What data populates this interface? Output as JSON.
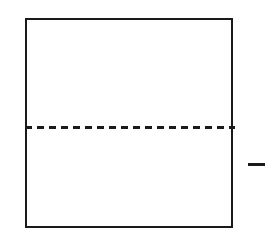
{
  "figure": {
    "kind": "geometric-diagram",
    "background_color": "#ffffff",
    "stroke_color": "#1a1a1a",
    "canvas": {
      "width": 265,
      "height": 236
    },
    "shapes": {
      "outer_rect": {
        "name": "square-outline",
        "x": 25,
        "y": 18,
        "width": 208,
        "height": 210,
        "stroke_width": 2,
        "fill": "#ffffff",
        "style": "solid"
      },
      "divider_line": {
        "name": "horizontal-dashed-divider",
        "x": 25,
        "y": 127,
        "length": 210,
        "stroke_width": 3,
        "style": "dashed",
        "dash_length": 7,
        "dash_gap": 5
      },
      "right_tick": {
        "name": "right-dash-marker",
        "x": 248,
        "y": 163,
        "length": 17,
        "stroke_width": 3,
        "style": "solid"
      }
    },
    "labels": []
  }
}
